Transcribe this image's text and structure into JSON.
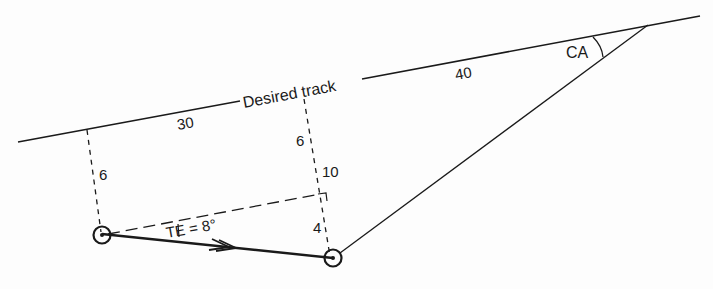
{
  "diagram": {
    "type": "navigation-track-geometry",
    "labels": {
      "desired_track": "Desired track",
      "dist_30": "30",
      "dist_40": "40",
      "left_offset": "6",
      "mid_offset_top": "6",
      "mid_offset_total": "10",
      "mid_offset_bottom": "4",
      "track_error": "TE = 8°",
      "closing_angle": "CA"
    },
    "colors": {
      "line": "#1a1a1a",
      "background": "#fdfdfd"
    }
  }
}
